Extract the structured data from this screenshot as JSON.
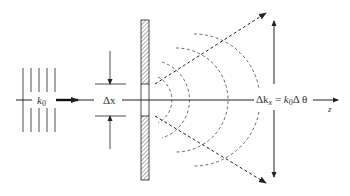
{
  "diagram": {
    "labels": {
      "incident_wavevector": "k",
      "incident_wavevector_sub": "0",
      "slit_width": "Δx",
      "spread_lhs_delta": "Δk",
      "spread_lhs_sub": "x",
      "spread_equals": " = ",
      "spread_rhs_k": "k",
      "spread_rhs_sub": "0",
      "spread_rhs_delta_theta": "Δ θ",
      "axis": "z"
    },
    "colors": {
      "stroke": "#222222",
      "hatch": "#333333",
      "background": "#ffffff"
    }
  }
}
